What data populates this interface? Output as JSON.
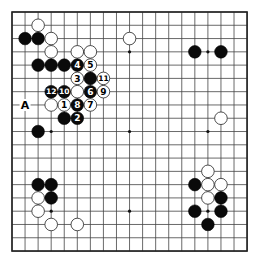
{
  "board": {
    "size": 19,
    "origin_x": 12,
    "origin_y": 12,
    "spacing_x": 13.06,
    "spacing_y": 13.28,
    "stone_radius": 6.3,
    "star_points": [
      [
        3,
        3
      ],
      [
        9,
        3
      ],
      [
        15,
        3
      ],
      [
        3,
        9
      ],
      [
        9,
        9
      ],
      [
        15,
        9
      ],
      [
        3,
        15
      ],
      [
        9,
        15
      ],
      [
        15,
        15
      ]
    ],
    "colors": {
      "line": "#444444",
      "black": "#0a0a0a",
      "white": "#ffffff",
      "background": "#ffffff"
    }
  },
  "stones": [
    {
      "color": "white",
      "col": 2,
      "row": 1
    },
    {
      "color": "black",
      "col": 1,
      "row": 2
    },
    {
      "color": "black",
      "col": 2,
      "row": 2
    },
    {
      "color": "white",
      "col": 3,
      "row": 2
    },
    {
      "color": "white",
      "col": 3,
      "row": 3
    },
    {
      "color": "white",
      "col": 5,
      "row": 3
    },
    {
      "color": "white",
      "col": 6,
      "row": 3
    },
    {
      "color": "white",
      "col": 9,
      "row": 2
    },
    {
      "color": "black",
      "col": 14,
      "row": 3
    },
    {
      "color": "black",
      "col": 16,
      "row": 3
    },
    {
      "color": "black",
      "col": 2,
      "row": 4
    },
    {
      "color": "black",
      "col": 3,
      "row": 4
    },
    {
      "color": "black",
      "col": 4,
      "row": 4
    },
    {
      "color": "black",
      "col": 5,
      "row": 4,
      "number": "4"
    },
    {
      "color": "white",
      "col": 6,
      "row": 4,
      "number": "5"
    },
    {
      "color": "white",
      "col": 5,
      "row": 5,
      "number": "3"
    },
    {
      "color": "black",
      "col": 6,
      "row": 5
    },
    {
      "color": "white",
      "col": 7,
      "row": 5,
      "number": "11"
    },
    {
      "color": "black",
      "col": 3,
      "row": 6,
      "number": "12"
    },
    {
      "color": "black",
      "col": 4,
      "row": 6,
      "number": "10"
    },
    {
      "color": "white",
      "col": 5,
      "row": 6
    },
    {
      "color": "black",
      "col": 6,
      "row": 6,
      "number": "6"
    },
    {
      "color": "white",
      "col": 7,
      "row": 6,
      "number": "9"
    },
    {
      "color": "white",
      "col": 3,
      "row": 7
    },
    {
      "color": "white",
      "col": 4,
      "row": 7,
      "number": "1"
    },
    {
      "color": "black",
      "col": 5,
      "row": 7,
      "number": "8"
    },
    {
      "color": "white",
      "col": 6,
      "row": 7,
      "number": "7"
    },
    {
      "color": "black",
      "col": 4,
      "row": 8
    },
    {
      "color": "black",
      "col": 5,
      "row": 8,
      "number": "2"
    },
    {
      "color": "black",
      "col": 2,
      "row": 9
    },
    {
      "color": "white",
      "col": 16,
      "row": 8
    },
    {
      "color": "black",
      "col": 2,
      "row": 13
    },
    {
      "color": "black",
      "col": 3,
      "row": 13
    },
    {
      "color": "white",
      "col": 2,
      "row": 14
    },
    {
      "color": "black",
      "col": 3,
      "row": 14
    },
    {
      "color": "white",
      "col": 2,
      "row": 15
    },
    {
      "color": "white",
      "col": 3,
      "row": 16
    },
    {
      "color": "white",
      "col": 5,
      "row": 16
    },
    {
      "color": "white",
      "col": 15,
      "row": 12
    },
    {
      "color": "black",
      "col": 14,
      "row": 13
    },
    {
      "color": "white",
      "col": 15,
      "row": 13
    },
    {
      "color": "white",
      "col": 16,
      "row": 13
    },
    {
      "color": "white",
      "col": 15,
      "row": 14
    },
    {
      "color": "black",
      "col": 16,
      "row": 14
    },
    {
      "color": "black",
      "col": 14,
      "row": 15
    },
    {
      "color": "black",
      "col": 16,
      "row": 15
    },
    {
      "color": "black",
      "col": 15,
      "row": 16
    }
  ],
  "labels": [
    {
      "text": "A",
      "col": 1,
      "row": 7
    }
  ]
}
